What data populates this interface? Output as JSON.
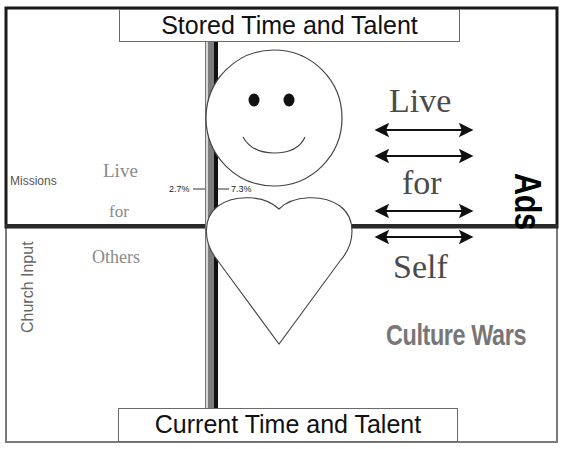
{
  "diagram": {
    "top_title": "Stored Time and Talent",
    "bottom_title": "Current Time and Talent",
    "left_side": {
      "label_missions": "Missions",
      "label_church_input": "Church Input",
      "live": "Live",
      "for": "for",
      "others": "Others"
    },
    "center": {
      "percent_left": "2.7%",
      "percent_right": "7.3%",
      "face_icon": "smiley-face",
      "heart_icon": "heart"
    },
    "right_side": {
      "live": "Live",
      "for": "for",
      "self": "Self",
      "ads": "Ads",
      "culture_wars": "Culture Wars",
      "arrow_count": 4
    },
    "colors": {
      "frame_dark": "#1a1a1a",
      "frame_gray": "#7a7a7a",
      "bar_gray": "#7d7d7d",
      "text_gray": "#8a8a8a",
      "culture_wars": "#777777"
    }
  }
}
